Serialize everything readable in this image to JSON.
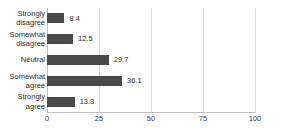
{
  "chart_data": {
    "type": "bar",
    "orientation": "horizontal",
    "title": "",
    "subtitle": "",
    "xlabel": "",
    "ylabel": "",
    "categories": [
      "Strongly disagree",
      "Somewhat disagree",
      "Neutral",
      "Somewhat agree",
      "Strongly agree"
    ],
    "category_lines": [
      [
        "Strongly",
        "disagree"
      ],
      [
        "Somewhat",
        "disagree"
      ],
      [
        "Neutral"
      ],
      [
        "Somewhat",
        "agree"
      ],
      [
        "Strongly",
        "agree"
      ]
    ],
    "values": [
      8.4,
      12.5,
      29.7,
      36.1,
      13.3
    ],
    "value_labels": [
      "8.4",
      "12.5",
      "29.7",
      "36.1",
      "13.3"
    ],
    "xlim": [
      0,
      100
    ],
    "xticks": [
      0,
      25,
      50,
      75,
      100
    ],
    "xtick_labels": [
      "0",
      "25",
      "50",
      "75",
      "100"
    ],
    "grid": true,
    "grid_axis": "x",
    "legend": false,
    "bar_color": "#494949",
    "grid_color": "#d9d9d9",
    "axis_color": "#bfbfbf",
    "text_color": "#2b2b2b",
    "background": "#ffffff"
  }
}
